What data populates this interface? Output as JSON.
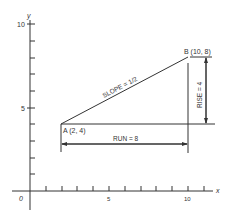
{
  "diagram": {
    "title": "",
    "axes": {
      "x_label": "x",
      "y_label": "y",
      "origin_label": "0",
      "x_tick_labels": [
        "5",
        "10"
      ],
      "y_tick_labels": [
        "5",
        "10"
      ],
      "x_range": [
        0,
        11
      ],
      "y_range": [
        0,
        10
      ]
    },
    "points": [
      {
        "name": "A",
        "label": "A (2, 4)",
        "x": 2,
        "y": 4
      },
      {
        "name": "B",
        "label": "B (10, 8)",
        "x": 10,
        "y": 8
      }
    ],
    "annotations": {
      "slope": "SLOPE = 1/2",
      "rise": "RISE = 4",
      "run": "RUN = 8"
    },
    "colors": {
      "line": "#333333",
      "background": "#ffffff"
    }
  }
}
